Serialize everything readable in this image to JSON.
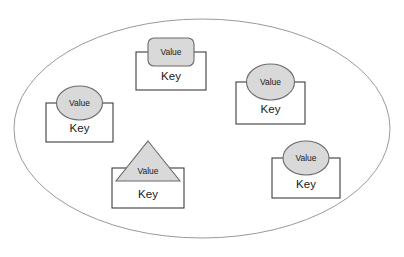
{
  "figure": {
    "title": "",
    "container": {
      "shape_name": "boundary-ellipse",
      "shape": "ellipse",
      "cx": 202,
      "cy": 128,
      "rx": 188,
      "ry": 110,
      "fill": "#ffffff",
      "stroke": "#9a9a9a"
    },
    "style": {
      "value_fill": "#d9d9d9",
      "value_stroke": "#6b6b6b",
      "key_fill": "#ffffff",
      "key_stroke": "#3d3d3d",
      "text_color": "#1a1a1a",
      "background": "#ffffff"
    },
    "nodes": [
      {
        "id": "node-top",
        "key_label": "Key",
        "value_label": "Value",
        "value_shape": "rounded-rectangle",
        "box": {
          "x": 136,
          "y": 52,
          "w": 70,
          "h": 38
        },
        "value": {
          "cx": 171,
          "cy": 52,
          "w": 46,
          "h": 28,
          "r": 6
        }
      },
      {
        "id": "node-left",
        "key_label": "Key",
        "value_label": "Value",
        "value_shape": "ellipse",
        "box": {
          "x": 46,
          "y": 103,
          "w": 67,
          "h": 39
        },
        "value": {
          "cx": 79,
          "cy": 103,
          "rx": 23,
          "ry": 17
        }
      },
      {
        "id": "node-right-upper",
        "key_label": "Key",
        "value_label": "Value",
        "value_shape": "ellipse",
        "box": {
          "x": 236,
          "y": 82,
          "w": 69,
          "h": 42
        },
        "value": {
          "cx": 270,
          "cy": 82,
          "rx": 24,
          "ry": 18
        }
      },
      {
        "id": "node-bottom-left",
        "key_label": "Key",
        "value_label": "Value",
        "value_shape": "triangle",
        "box": {
          "x": 112,
          "y": 168,
          "w": 72,
          "h": 40
        },
        "value": {
          "cx": 148,
          "cy": 168,
          "w": 60,
          "h": 42
        }
      },
      {
        "id": "node-bottom-right",
        "key_label": "Key",
        "value_label": "Value",
        "value_shape": "ellipse",
        "box": {
          "x": 272,
          "y": 158,
          "w": 68,
          "h": 40
        },
        "value": {
          "cx": 306,
          "cy": 158,
          "rx": 23,
          "ry": 17
        }
      }
    ]
  }
}
